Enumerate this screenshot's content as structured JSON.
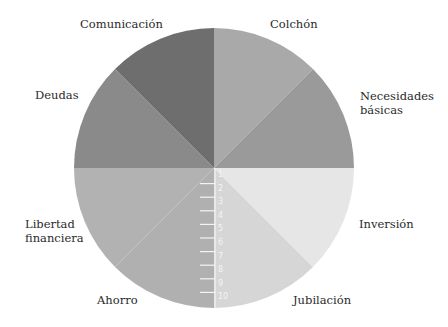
{
  "chart_data": {
    "type": "pie",
    "title": "",
    "subtitle": "",
    "center": [
      214,
      168
    ],
    "radius": 140,
    "start_angle_deg": -90,
    "direction": "clockwise",
    "slices": [
      {
        "name": "Colchón",
        "value": 1,
        "color": "#a9a9a9"
      },
      {
        "name": "Necesidades básicas",
        "value": 1,
        "color": "#9a9a9a"
      },
      {
        "name": "Inversión",
        "value": 1,
        "color": "#e6e6e6"
      },
      {
        "name": "Jubilación",
        "value": 1,
        "color": "#d6d6d6"
      },
      {
        "name": "Ahorro",
        "value": 1,
        "color": "#b0b0b0"
      },
      {
        "name": "Libertad financiera",
        "value": 1,
        "color": "#b2b2b2"
      },
      {
        "name": "Deudas",
        "value": 1,
        "color": "#8a8a8a"
      },
      {
        "name": "Comunicación",
        "value": 1,
        "color": "#6e6e6e"
      }
    ],
    "categories": [
      "Colchón",
      "Necesidades básicas",
      "Inversión",
      "Jubilación",
      "Ahorro",
      "Libertad financiera",
      "Deudas",
      "Comunicación"
    ],
    "values": [
      1,
      1,
      1,
      1,
      1,
      1,
      1,
      1
    ],
    "scale": {
      "orientation": "vertical",
      "position": "radius from center downward",
      "tick_labels": [
        "1",
        "2",
        "3",
        "4",
        "5",
        "6",
        "7",
        "8",
        "9",
        "10"
      ],
      "min": 1,
      "max": 10,
      "color": "#f4f4f4"
    },
    "legend": "none (slice labels placed outside the circle)",
    "grid": false
  },
  "labels": {
    "comunicacion": "Comunicación",
    "colchon": "Colchón",
    "deudas": "Deudas",
    "necesidades": "Necesidades\nbásicas",
    "libertad": "Libertad\nfinanciera",
    "inversion": "Inversión",
    "ahorro": "Ahorro",
    "jubilacion": "Jubilación"
  }
}
